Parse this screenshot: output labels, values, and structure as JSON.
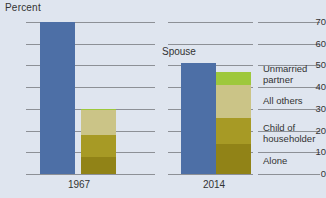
{
  "chart_data": {
    "type": "bar",
    "title": "",
    "subtitle": "",
    "ylabel": "Percent",
    "xlabel": "",
    "ylim": [
      0,
      70
    ],
    "yticks": [
      0,
      10,
      20,
      30,
      40,
      50,
      60,
      70
    ],
    "grid": true,
    "legend_position": "right",
    "categories": [
      "1967",
      "2014"
    ],
    "annotations": [
      {
        "text": "Spouse",
        "target": "2014 spouse bar",
        "x": 2014
      }
    ],
    "bars": [
      {
        "group": "1967",
        "name": "Spouse",
        "stacked": false,
        "value": 70,
        "color": "#4d6fa6"
      },
      {
        "group": "1967",
        "name": "Other living arrangements",
        "stacked": true,
        "total": 30,
        "segments": [
          {
            "label": "Unmarried partner",
            "value": 0.5,
            "color": "#9ec83c"
          },
          {
            "label": "All others",
            "value": 11.5,
            "color": "#cbc487"
          },
          {
            "label": "Child of householder",
            "value": 10,
            "color": "#a79a25"
          },
          {
            "label": "Alone",
            "value": 8,
            "color": "#918317"
          }
        ]
      },
      {
        "group": "2014",
        "name": "Spouse",
        "stacked": false,
        "value": 51,
        "color": "#4d6fa6"
      },
      {
        "group": "2014",
        "name": "Other living arrangements",
        "stacked": true,
        "total": 47,
        "segments": [
          {
            "label": "Unmarried partner",
            "value": 6,
            "color": "#9ec83c"
          },
          {
            "label": "All others",
            "value": 15,
            "color": "#cbc487"
          },
          {
            "label": "Child of householder",
            "value": 12,
            "color": "#a79a25"
          },
          {
            "label": "Alone",
            "value": 14,
            "color": "#918317"
          }
        ]
      }
    ],
    "legend": [
      {
        "label": "Unmarried partner",
        "color": "#9ec83c"
      },
      {
        "label": "All others",
        "color": "#cbc487"
      },
      {
        "label": "Child of householder",
        "color": "#a79a25"
      },
      {
        "label": "Alone",
        "color": "#918317"
      }
    ]
  },
  "axis": {
    "ylabel": "Percent",
    "ticks": [
      "70",
      "60",
      "50",
      "40",
      "30",
      "20",
      "10",
      "0"
    ]
  },
  "groups": {
    "first": "1967",
    "second": "2014"
  },
  "labels": {
    "spouse": "Spouse"
  },
  "legend": {
    "items": [
      {
        "label_line1": "Unmarried",
        "label_line2": "partner"
      },
      {
        "label_line1": "All others",
        "label_line2": ""
      },
      {
        "label_line1": "Child of",
        "label_line2": "householder"
      },
      {
        "label_line1": "Alone",
        "label_line2": ""
      }
    ]
  },
  "colors": {
    "background": "#dfe5ef",
    "blue": "#4d6fa6",
    "green": "#9ec83c",
    "khaki": "#cbc487",
    "olive": "#a79a25",
    "dark_olive": "#918317",
    "gridline": "#8d9096"
  }
}
